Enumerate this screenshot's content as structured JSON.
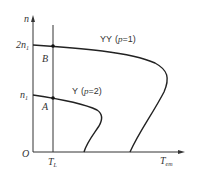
{
  "diagram": {
    "axes": {
      "y_label": "n",
      "x_label": "T",
      "x_label_sub": "em",
      "origin": "O"
    },
    "y_ticks": [
      {
        "main": "2n",
        "sub": "1"
      },
      {
        "main": "n",
        "sub": "1"
      }
    ],
    "x_ticks": [
      {
        "main": "T",
        "sub": "L"
      }
    ],
    "points": [
      {
        "label": "B"
      },
      {
        "label": "A"
      }
    ],
    "curves": [
      {
        "name": "YY",
        "param_open": "(",
        "param": "p",
        "param_eq": "=1",
        "param_close": ")"
      },
      {
        "name": "Y",
        "param_open": "(",
        "param": "p",
        "param_eq": "=2",
        "param_close": ")"
      }
    ],
    "colors": {
      "line": "#333333"
    }
  }
}
